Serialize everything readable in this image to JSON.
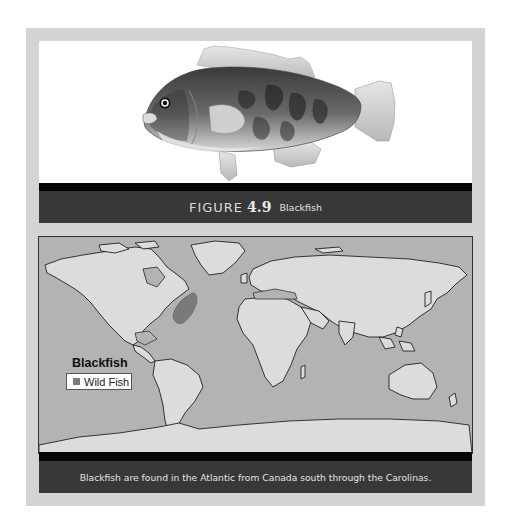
{
  "figure": {
    "label_word": "FIGURE",
    "label_number": "4.9",
    "label_name": "Blackfish",
    "illustration": "blackfish-illustration"
  },
  "map": {
    "legend": {
      "title": "Blackfish",
      "items": [
        {
          "label": "Wild Fish",
          "color": "#7a7a7a"
        }
      ]
    },
    "colors": {
      "ocean": "#b3b3b3",
      "land": "#dcdcdc",
      "range": "#7a7a7a",
      "coastline": "#222222"
    },
    "caption": "Blackfish are found in the Atlantic from Canada south through the Carolinas."
  },
  "colors": {
    "frame": "#d4d4d4",
    "caption_bar": "#383838",
    "strip": "#060606"
  }
}
